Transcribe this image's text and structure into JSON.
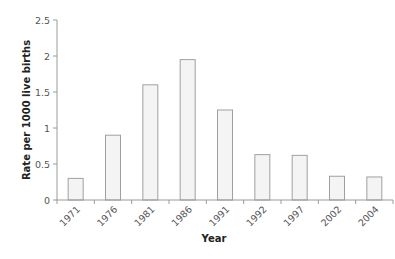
{
  "chart_data": {
    "type": "bar",
    "title": "",
    "xlabel": "Year",
    "ylabel": "Rate per 1000 live births",
    "categories": [
      "1971",
      "1976",
      "1981",
      "1986",
      "1991",
      "1992",
      "1997",
      "2002",
      "2004"
    ],
    "values": [
      0.3,
      0.9,
      1.6,
      1.95,
      1.25,
      0.63,
      0.62,
      0.33,
      0.32
    ],
    "ylim": [
      0,
      2.5
    ],
    "yticks": [
      "0",
      "0.5",
      "1",
      "1.5",
      "2",
      "2.5"
    ],
    "grid": false,
    "legend": null,
    "colors": {
      "bar_fill": "#f4f4f4",
      "bar_stroke": "#a0a0a0",
      "axis": "#9a9a9a"
    }
  }
}
